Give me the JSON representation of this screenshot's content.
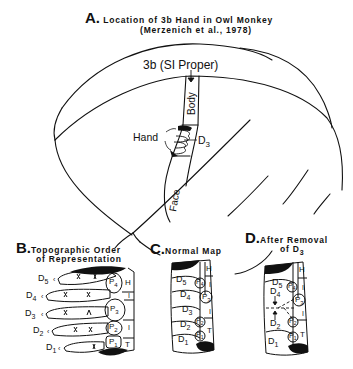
{
  "panel_a": {
    "letter": "A.",
    "title": "Location of 3b Hand in Owl Monkey",
    "citation": "(Merzenich et al., 1978)",
    "area_label": "3b (SI Proper)",
    "strip_labels": {
      "body": "Body",
      "hand": "Hand",
      "face": "Face",
      "digit": "D",
      "digit_sub": "3"
    }
  },
  "panel_b": {
    "letter": "B.",
    "title_line1": "Topographic Order",
    "title_line2": "of Representation",
    "digits": [
      {
        "label": "D",
        "sub": "5"
      },
      {
        "label": "D",
        "sub": "4"
      },
      {
        "label": "D",
        "sub": "3"
      },
      {
        "label": "D",
        "sub": "2"
      },
      {
        "label": "D",
        "sub": "1"
      }
    ],
    "pads": [
      {
        "label": "P",
        "sub": "4"
      },
      {
        "label": "P",
        "sub": "3"
      },
      {
        "label": "P",
        "sub": "2"
      },
      {
        "label": "P",
        "sub": "1"
      }
    ],
    "side_labels": [
      "H",
      "I",
      "I",
      "T"
    ]
  },
  "panel_c": {
    "letter": "C.",
    "title": "Normal Map",
    "digits": [
      {
        "label": "D",
        "sub": "5"
      },
      {
        "label": "D",
        "sub": "4"
      },
      {
        "label": "D",
        "sub": "3"
      },
      {
        "label": "D",
        "sub": "2"
      },
      {
        "label": "D",
        "sub": "1"
      }
    ],
    "pads": [
      {
        "label": "P",
        "sub": "4"
      },
      {
        "label": "P",
        "sub": "3"
      },
      {
        "label": "P",
        "sub": "2"
      },
      {
        "label": "P",
        "sub": "1"
      }
    ],
    "side_labels": [
      "H",
      "I",
      "I",
      "T"
    ]
  },
  "panel_d": {
    "letter": "D.",
    "title_line1": "After Removal",
    "title_line2": "of D",
    "title_sub": "3",
    "digits": [
      {
        "label": "D",
        "sub": "5"
      },
      {
        "label": "D",
        "sub": "4"
      },
      {
        "label": "D",
        "sub": "2"
      },
      {
        "label": "D",
        "sub": "1"
      }
    ],
    "pads": [
      {
        "label": "P",
        "sub": "4"
      },
      {
        "label": "P",
        "sub": "3"
      },
      {
        "label": "P",
        "sub": "2"
      },
      {
        "label": "P",
        "sub": "1"
      }
    ],
    "side_labels": [
      "H",
      "I",
      "I",
      "T"
    ]
  }
}
